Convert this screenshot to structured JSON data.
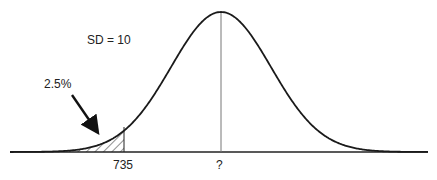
{
  "diagram": {
    "type": "normal-distribution-curve",
    "sd_label": "SD = 10",
    "tail_area_label": "2.5%",
    "x_ticks": {
      "cutoff": "735",
      "mean": "?"
    },
    "shaded_region": "left tail below 735 (hatched)",
    "arrow": "points from 2.5% label to hatched tail",
    "colors": {
      "curve": "#1a1a1a",
      "mean_line": "#777777",
      "baseline": "#222222",
      "hatch": "#333333"
    }
  }
}
